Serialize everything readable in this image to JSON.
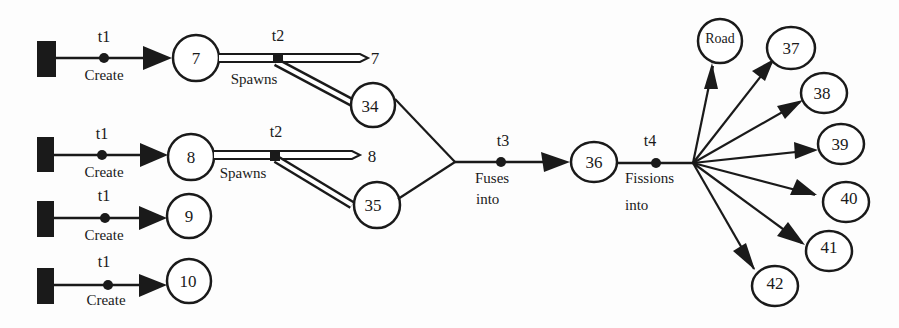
{
  "diagram": {
    "type": "object-lifecycle-flow",
    "colors": {
      "ink": "#1a1a1a",
      "background": "#fdfdfd"
    },
    "sources": [
      {
        "id": "src1",
        "row": 1
      },
      {
        "id": "src2",
        "row": 2
      },
      {
        "id": "src3",
        "row": 3
      },
      {
        "id": "src4",
        "row": 4
      }
    ],
    "transitions": {
      "create": [
        {
          "time": "t1",
          "label": "Create",
          "target": "7"
        },
        {
          "time": "t1",
          "label": "Create",
          "target": "8"
        },
        {
          "time": "t1",
          "label": "Create",
          "target": "9"
        },
        {
          "time": "t1",
          "label": "Create",
          "target": "10"
        }
      ],
      "spawn": [
        {
          "time": "t2",
          "label": "Spawns",
          "source": "7",
          "continues_as": "7",
          "spawned": "34"
        },
        {
          "time": "t2",
          "label": "Spawns",
          "source": "8",
          "continues_as": "8",
          "spawned": "35"
        }
      ],
      "fuse": {
        "time": "t3",
        "label_line1": "Fuses",
        "label_line2": "into",
        "sources": [
          "34",
          "35"
        ],
        "target": "36"
      },
      "fission": {
        "time": "t4",
        "label_line1": "Fissions",
        "label_line2": "into",
        "source": "36",
        "targets": [
          "Road",
          "37",
          "38",
          "39",
          "40",
          "41",
          "42"
        ]
      }
    },
    "nodes": {
      "n7": "7",
      "n8": "8",
      "n9": "9",
      "n10": "10",
      "n34": "34",
      "n35": "35",
      "n36": "36",
      "road": "Road",
      "n37": "37",
      "n38": "38",
      "n39": "39",
      "n40": "40",
      "n41": "41",
      "n42": "42"
    },
    "continuations": {
      "c7": "7",
      "c8": "8"
    }
  }
}
